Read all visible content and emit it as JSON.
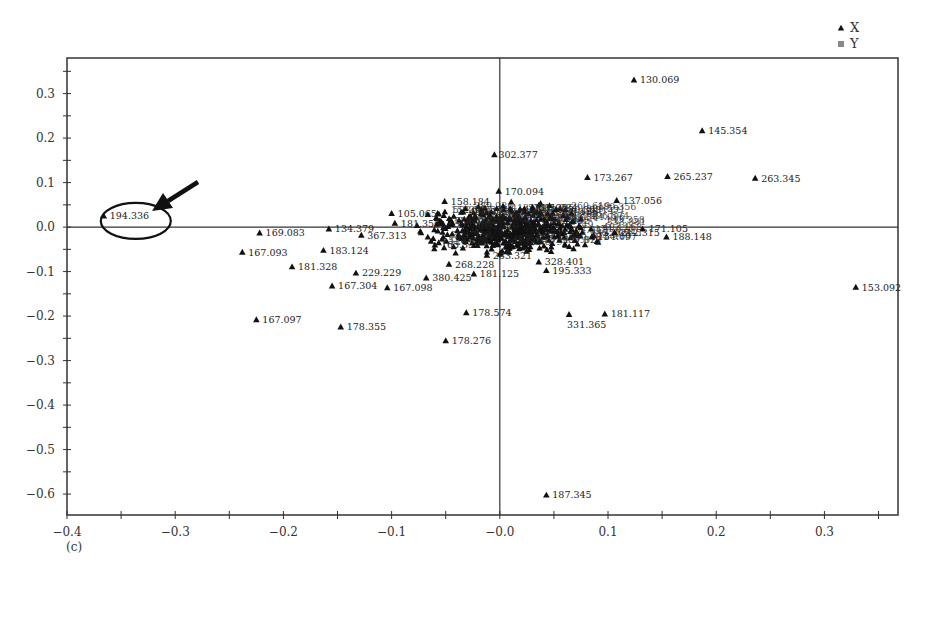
{
  "chart_data": {
    "type": "scatter",
    "title": "",
    "panel_label": "(c)",
    "xlabel": "",
    "ylabel": "",
    "xlim": [
      -0.4,
      0.368
    ],
    "ylim": [
      -0.647,
      0.38
    ],
    "x_ticks": [
      -0.4,
      -0.3,
      -0.2,
      -0.1,
      0.0,
      0.1,
      0.2,
      0.3
    ],
    "x_tick_labels": [
      "-0.4",
      "-0.3",
      "-0.2",
      "-0.1",
      "-0.0",
      "0.1",
      "0.2",
      "0.3"
    ],
    "y_ticks": [
      0.3,
      0.2,
      0.1,
      0.0,
      -0.1,
      -0.2,
      -0.3,
      -0.4,
      -0.5,
      -0.6
    ],
    "y_tick_labels": [
      "0.3",
      "0.2",
      "0.1",
      "0.0",
      "-0.1",
      "-0.2",
      "-0.3",
      "-0.4",
      "-0.5",
      "-0.6"
    ],
    "grid": false,
    "reference_lines": {
      "x": 0.0,
      "y": 0.0
    },
    "legend": {
      "position": "top-right",
      "entries": [
        {
          "label": "X",
          "marker": "triangle",
          "color": "#222222"
        },
        {
          "label": "Y",
          "marker": "square",
          "color": "#888888"
        }
      ]
    },
    "annotation": {
      "type": "ellipse-with-arrow",
      "target_label": "194.336",
      "description": "Outlier circled and pointed to by arrow"
    },
    "series": [
      {
        "name": "X",
        "marker": "triangle",
        "points": [
          {
            "label": "194.336",
            "x": -0.366,
            "y": 0.025
          },
          {
            "label": "169.083",
            "x": -0.222,
            "y": -0.013
          },
          {
            "label": "167.093",
            "x": -0.238,
            "y": -0.056
          },
          {
            "label": "181.328",
            "x": -0.192,
            "y": -0.089
          },
          {
            "label": "167.097",
            "x": -0.225,
            "y": -0.208
          },
          {
            "label": "134.379",
            "x": -0.158,
            "y": -0.004
          },
          {
            "label": "183.124",
            "x": -0.163,
            "y": -0.052
          },
          {
            "label": "367.313",
            "x": -0.128,
            "y": -0.018
          },
          {
            "label": "229.229",
            "x": -0.133,
            "y": -0.103
          },
          {
            "label": "167.304",
            "x": -0.155,
            "y": -0.132
          },
          {
            "label": "178.355",
            "x": -0.147,
            "y": -0.224
          },
          {
            "label": "105.065",
            "x": -0.1,
            "y": 0.031
          },
          {
            "label": "181.356",
            "x": -0.097,
            "y": 0.009
          },
          {
            "label": "167.098",
            "x": -0.104,
            "y": -0.136
          },
          {
            "label": "380.425",
            "x": -0.068,
            "y": -0.114
          },
          {
            "label": "158.184",
            "x": -0.051,
            "y": 0.058
          },
          {
            "label": "465.30",
            "x": -0.034,
            "y": 0.034
          },
          {
            "label": "165.332",
            "x": -0.06,
            "y": -0.04
          },
          {
            "label": "268.228",
            "x": -0.047,
            "y": -0.083
          },
          {
            "label": "181.125",
            "x": -0.024,
            "y": -0.105
          },
          {
            "label": "178.574",
            "x": -0.031,
            "y": -0.192
          },
          {
            "label": "178.276",
            "x": -0.05,
            "y": -0.255
          },
          {
            "label": "302.377",
            "x": -0.005,
            "y": 0.163
          },
          {
            "label": "170.094",
            "x": -0.001,
            "y": 0.081
          },
          {
            "label": "283.321",
            "x": -0.012,
            "y": -0.063
          },
          {
            "label": "611.284",
            "x": 0.03,
            "y": 0.045
          },
          {
            "label": "330.363",
            "x": 0.052,
            "y": 0.04
          },
          {
            "label": "328.401",
            "x": 0.036,
            "y": -0.078
          },
          {
            "label": "195.333",
            "x": 0.043,
            "y": -0.097
          },
          {
            "label": "331.365",
            "x": 0.064,
            "y": -0.196
          },
          {
            "label": "187.345",
            "x": 0.043,
            "y": -0.602
          },
          {
            "label": "154.097",
            "x": 0.085,
            "y": -0.022
          },
          {
            "label": "173.267",
            "x": 0.081,
            "y": 0.112
          },
          {
            "label": "137.056",
            "x": 0.108,
            "y": 0.06
          },
          {
            "label": "212.315",
            "x": 0.106,
            "y": -0.012
          },
          {
            "label": "171.105",
            "x": 0.132,
            "y": -0.004
          },
          {
            "label": "188.148",
            "x": 0.154,
            "y": -0.022
          },
          {
            "label": "181.117",
            "x": 0.097,
            "y": -0.195
          },
          {
            "label": "130.069",
            "x": 0.124,
            "y": 0.331
          },
          {
            "label": "145.354",
            "x": 0.187,
            "y": 0.217
          },
          {
            "label": "265.237",
            "x": 0.155,
            "y": 0.114
          },
          {
            "label": "263.345",
            "x": 0.236,
            "y": 0.11
          },
          {
            "label": "153.092",
            "x": 0.329,
            "y": -0.135
          }
        ],
        "dense_cluster": {
          "description": "Several hundred overlapping unlabeled-legible points",
          "x_range": [
            -0.06,
            0.09
          ],
          "y_range": [
            -0.05,
            0.05
          ]
        }
      }
    ]
  }
}
